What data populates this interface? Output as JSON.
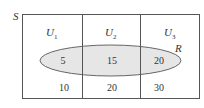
{
  "diagram": {
    "universe_label": "S",
    "set_label": "R",
    "columns": [
      {
        "name": "U",
        "sub": "1",
        "inside_R": "5",
        "outside_R": "10"
      },
      {
        "name": "U",
        "sub": "2",
        "inside_R": "15",
        "outside_R": "20"
      },
      {
        "name": "U",
        "sub": "3",
        "inside_R": "20",
        "outside_R": "30"
      }
    ],
    "colors": {
      "border": "#555555",
      "ellipse_fill": "#e6e6e6",
      "ellipse_stroke": "#666666",
      "text": "#333333"
    }
  }
}
